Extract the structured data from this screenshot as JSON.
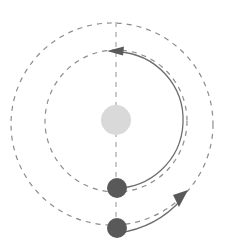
{
  "figure": {
    "title": "",
    "background_color": "#ffffff",
    "width": 230,
    "height": 247
  },
  "chart_data": {
    "type": "diagram",
    "subtype": "orbital-system-schematic",
    "title": "",
    "xlabel": "",
    "ylabel": "",
    "grid": false,
    "legend": "none",
    "colors": {
      "star_fill": "#d9d9d9",
      "planet_fill": "#595959",
      "dashed_orbit_stroke": "#8c8c8c",
      "solid_orbit_stroke": "#6e6e6e",
      "axis_stroke": "#a6a6a6",
      "arrow_fill": "#595959"
    },
    "elements": [
      {
        "name": "outer-dashed-orbit",
        "shape": "circle",
        "style": "dashed",
        "cx": 112,
        "cy": 124,
        "r": 101,
        "stroke": "#8c8c8c",
        "stroke_width": 1.2,
        "dash": "5 5"
      },
      {
        "name": "middle-dashed-orbit",
        "shape": "circle",
        "style": "dashed",
        "cx": 116,
        "cy": 121,
        "r": 71,
        "stroke": "#8c8c8c",
        "stroke_width": 1.2,
        "dash": "5 5"
      },
      {
        "name": "inner-solid-orbit",
        "shape": "arc",
        "style": "solid",
        "cx": 116,
        "cy": 120,
        "r": 68,
        "stroke": "#6e6e6e",
        "stroke_width": 1.3
      },
      {
        "name": "vertical-axis",
        "shape": "line",
        "style": "dashed",
        "x1": 116,
        "y1": 22,
        "x2": 116,
        "y2": 232,
        "stroke": "#a6a6a6",
        "stroke_width": 1.2,
        "dash": "5 5"
      },
      {
        "name": "star",
        "shape": "circle",
        "cx": 116,
        "cy": 120,
        "r": 15,
        "fill": "#d9d9d9"
      },
      {
        "name": "inner-planet",
        "shape": "circle",
        "cx": 117,
        "cy": 188,
        "r": 10,
        "fill": "#595959"
      },
      {
        "name": "outer-planet",
        "shape": "circle",
        "cx": 117,
        "cy": 228,
        "r": 10,
        "fill": "#595959"
      },
      {
        "name": "inner-orbit-direction-arrowhead",
        "shape": "arrowhead",
        "x": 113,
        "y": 51,
        "direction": "left",
        "fill": "#595959"
      },
      {
        "name": "outer-orbit-direction-arrowhead",
        "shape": "arrowhead",
        "x": 183,
        "y": 197,
        "direction": "upper-right",
        "fill": "#595959"
      }
    ],
    "annotations": []
  }
}
